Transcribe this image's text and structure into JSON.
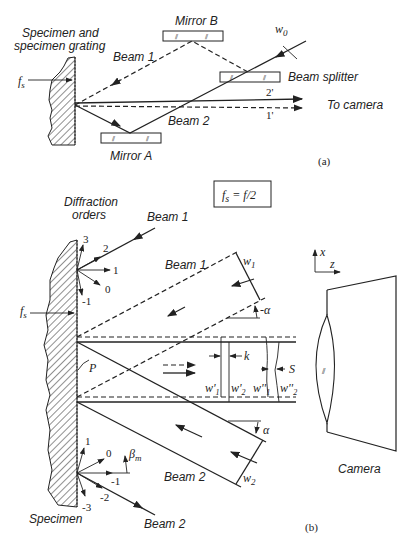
{
  "panel_a": {
    "specimen_label_line1": "Specimen and",
    "specimen_label_line2": "specimen grating",
    "fs_label": "f",
    "fs_sub": "s",
    "mirror_b": "Mirror B",
    "mirror_a": "Mirror A",
    "beam1": "Beam 1",
    "beam2": "Beam 2",
    "w0": "w",
    "w0_sub": "0",
    "beam_splitter": "Beam splitter",
    "ray_2prime": "2'",
    "ray_1prime": "1'",
    "to_camera": "To camera",
    "caption": "(a)"
  },
  "equation_box": {
    "lhs": "f",
    "lhs_sub": "s",
    "rhs": " = f/2"
  },
  "panel_b": {
    "diffraction_line1": "Diffraction",
    "diffraction_line2": "orders",
    "upper_orders": [
      "3",
      "2",
      "1",
      "0",
      "-1"
    ],
    "lower_orders": [
      "1",
      "0",
      "-1",
      "-2",
      "-3"
    ],
    "beam1_top": "Beam 1",
    "beam1_mid": "Beam 1",
    "beam2_mid": "Beam 2",
    "beam2_bottom": "Beam 2",
    "fs_label": "f",
    "fs_sub": "s",
    "P_label": "P",
    "w1": "w",
    "w1_sub": "1",
    "w2": "w",
    "w2_sub": "2",
    "alpha_top": "-α",
    "alpha_bottom": "α",
    "k_label": "k",
    "S_label": "S",
    "w1_prime": "w'",
    "w1_prime_sub": "1",
    "w2_prime": "w'",
    "w2_prime_sub": "2",
    "w1_dprime": "w''",
    "w1_dprime_sub": "1",
    "w2_dprime": "w''",
    "w2_dprime_sub": "2",
    "beta_label": "β",
    "beta_sub": "m",
    "axis_x": "x",
    "axis_z": "z",
    "camera": "Camera",
    "specimen": "Specimen",
    "caption": "(b)"
  }
}
